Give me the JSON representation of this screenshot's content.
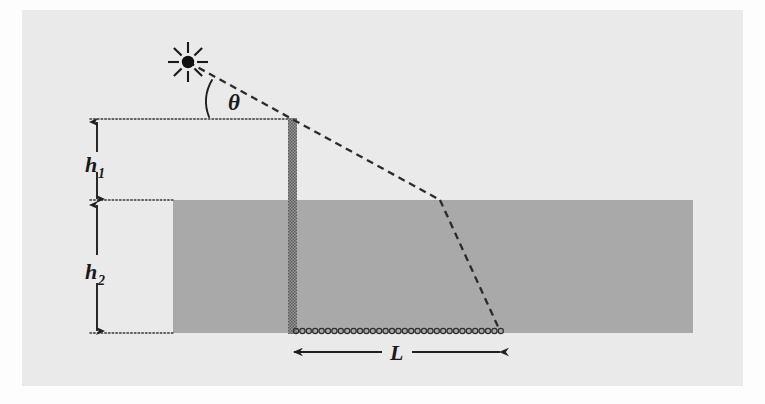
{
  "figure": {
    "type": "optics-refraction-diagram",
    "background_color": "#fdfdfd",
    "panel_color": "#eaeaea",
    "ink_color": "#2b2b2b"
  },
  "labels": {
    "angle": "θ",
    "height_above_base": "h",
    "height_above_sub": "1",
    "depth_water": "h",
    "depth_water_sub": "2",
    "length": "L"
  },
  "elements": {
    "point_source": {
      "name": "point-light-source",
      "x": 188,
      "y": 62,
      "radius": 6,
      "ray_count": 8,
      "ray_inner": 9,
      "ray_outer": 20
    },
    "post": {
      "name": "vertical-post",
      "x": 288,
      "y": 118,
      "width": 9,
      "height": 216,
      "fill": "#8c8c8c"
    },
    "water": {
      "name": "water-body",
      "x": 173,
      "y": 200,
      "width": 520,
      "height": 133,
      "fill": "#a9a9a9"
    },
    "bottom_chain": {
      "name": "sediment-bottom-chain",
      "x1": 293,
      "x2": 502,
      "y": 331,
      "bead_radius": 2.6,
      "bead_spacing": 6.4
    },
    "ray_incident": {
      "name": "incident-ray",
      "from_x": 188,
      "from_y": 62,
      "to_x": 440,
      "to_y": 200
    },
    "ray_refracted": {
      "name": "refracted-ray",
      "from_x": 440,
      "from_y": 200,
      "to_x": 500,
      "to_y": 331
    },
    "angle_arc": {
      "name": "theta-angle-arc",
      "label_x": 228,
      "label_y": 108
    }
  },
  "dimensions": {
    "h1": {
      "name": "h1-dimension",
      "axis_x": 97,
      "top_y": 120,
      "bottom_y": 200,
      "label_x": 97,
      "label_y": 166
    },
    "h2": {
      "name": "h2-dimension",
      "axis_x": 97,
      "top_y": 203,
      "bottom_y": 333,
      "label_x": 97,
      "label_y": 273
    },
    "L": {
      "name": "L-dimension",
      "axis_y": 352,
      "left_x": 293,
      "right_x": 501,
      "label_x": 398,
      "label_y": 360
    }
  },
  "guides": {
    "top_dotted": {
      "name": "top-guide-line",
      "x1": 90,
      "x2": 293,
      "y": 119
    },
    "mid_dotted": {
      "name": "waterline-guide",
      "x1": 90,
      "x2": 174,
      "y": 200
    },
    "bottom_dotted": {
      "name": "bottom-guide-line",
      "x1": 90,
      "x2": 174,
      "y": 333
    }
  }
}
